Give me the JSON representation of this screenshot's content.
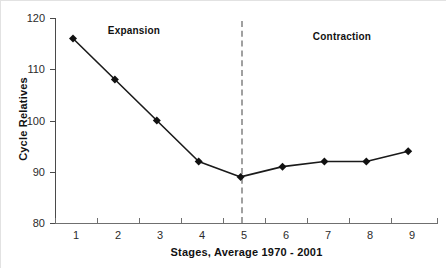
{
  "chart_data": {
    "type": "line",
    "title": "",
    "xlabel": "Stages, Average 1970 - 2001",
    "ylabel": "Cycle Relatives",
    "x": [
      1,
      2,
      3,
      4,
      5,
      6,
      7,
      8,
      9
    ],
    "categories": [
      "1",
      "2",
      "3",
      "4",
      "5",
      "6",
      "7",
      "8",
      "9"
    ],
    "values": [
      116,
      108,
      100,
      92,
      89,
      91,
      92,
      92,
      94
    ],
    "series": [
      {
        "name": "Cycle Relatives",
        "values": [
          116,
          108,
          100,
          92,
          89,
          91,
          92,
          92,
          94
        ]
      }
    ],
    "ylim": [
      80,
      120
    ],
    "yticks": [
      80,
      90,
      100,
      110,
      120
    ],
    "ytick_labels": [
      "80",
      "90",
      "100",
      "110",
      "120"
    ],
    "xlim": [
      0.5,
      9.5
    ],
    "grid": false,
    "legend": false,
    "marker": "diamond",
    "line_color": "#1a1a1a",
    "marker_color": "#111111",
    "annotations": [
      {
        "text": "Expansion",
        "x": 2.1,
        "y": 117.5
      },
      {
        "text": "Contraction",
        "x": 7.0,
        "y": 116.5
      },
      {
        "type": "vline",
        "label": "phase-divider",
        "x": 5,
        "style": "dashed",
        "color": "#a0a0a0"
      }
    ]
  },
  "axes": {
    "y_title": "Cycle Relatives",
    "x_title": "Stages, Average 1970 - 2001"
  },
  "labels": {
    "expansion": "Expansion",
    "contraction": "Contraction"
  },
  "colors": {
    "line": "#1a1a1a",
    "marker": "#111111",
    "divider": "#a0a0a0",
    "axis": "#4a4a4a",
    "background": "#ffffff"
  }
}
